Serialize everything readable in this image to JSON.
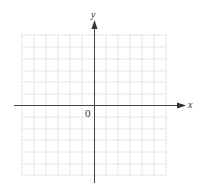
{
  "diagram": {
    "type": "coordinate-grid",
    "axes": {
      "x_label": "x",
      "y_label": "y",
      "origin_label": "0"
    },
    "grid": {
      "columns": 12,
      "rows": 12,
      "line_style": "dotted",
      "line_color": "#bbbbbb"
    },
    "colors": {
      "axis": "#444444",
      "background": "#ffffff"
    }
  }
}
